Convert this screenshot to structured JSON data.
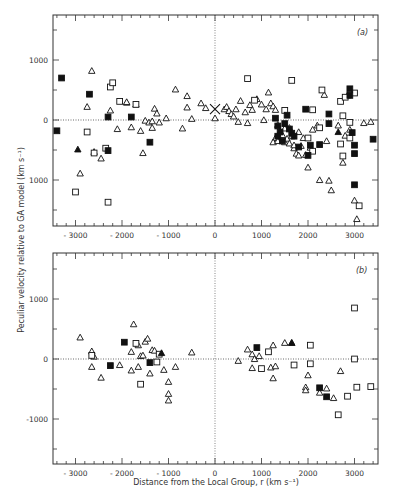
{
  "chart_data": [
    {
      "type": "scatter",
      "panel_label": "(a)",
      "xlabel": "Distance from the Local Group, r (km s⁻¹)",
      "ylabel": "Peculiar velocity relative to GA model (km s⁻¹)",
      "xlim": [
        -3500,
        3500
      ],
      "ylim": [
        -1750,
        1750
      ],
      "x_ticks": [
        -3000,
        -2000,
        -1000,
        0,
        1000,
        2000,
        3000
      ],
      "y_ticks": [
        1000,
        0,
        -1000
      ],
      "y_tick_labels": [
        "1000",
        "0",
        "1000"
      ],
      "reference_lines": {
        "horizontal_zero": "dotted",
        "vertical_zero": "dotted"
      },
      "series": [
        {
          "name": "open triangles",
          "marker": "triangle-open",
          "points": [
            [
              -2650,
              820
            ],
            [
              -2750,
              220
            ],
            [
              -2250,
              160
            ],
            [
              -2100,
              -150
            ],
            [
              -1900,
              290
            ],
            [
              -1700,
              260
            ],
            [
              -1800,
              -120
            ],
            [
              -1600,
              -180
            ],
            [
              -1550,
              -550
            ],
            [
              -1500,
              -10
            ],
            [
              -1420,
              -40
            ],
            [
              -1350,
              -20
            ],
            [
              -1350,
              -130
            ],
            [
              -1300,
              190
            ],
            [
              -1250,
              110
            ],
            [
              -1200,
              -40
            ],
            [
              -1050,
              30
            ],
            [
              -850,
              510
            ],
            [
              -700,
              -140
            ],
            [
              -600,
              400
            ],
            [
              -600,
              210
            ],
            [
              -500,
              20
            ],
            [
              -2450,
              -640
            ],
            [
              -2900,
              -890
            ],
            [
              -2600,
              -530
            ],
            [
              -1900,
              300
            ],
            [
              -300,
              280
            ],
            [
              -200,
              200
            ],
            [
              0,
              30
            ],
            [
              200,
              180
            ],
            [
              250,
              220
            ],
            [
              300,
              150
            ],
            [
              350,
              100
            ],
            [
              400,
              60
            ],
            [
              450,
              180
            ],
            [
              500,
              -30
            ],
            [
              550,
              320
            ],
            [
              650,
              130
            ],
            [
              700,
              -50
            ],
            [
              750,
              250
            ],
            [
              800,
              170
            ],
            [
              900,
              350
            ],
            [
              1000,
              260
            ],
            [
              1050,
              0
            ],
            [
              1100,
              180
            ],
            [
              1150,
              460
            ],
            [
              1200,
              280
            ],
            [
              1250,
              230
            ],
            [
              1300,
              170
            ],
            [
              1350,
              -80
            ],
            [
              1400,
              -230
            ],
            [
              1450,
              -250
            ],
            [
              1500,
              -370
            ],
            [
              1550,
              -310
            ],
            [
              1600,
              -130
            ],
            [
              1650,
              -270
            ],
            [
              1700,
              -470
            ],
            [
              1750,
              -560
            ],
            [
              1800,
              -590
            ],
            [
              1850,
              -430
            ],
            [
              1900,
              -300
            ],
            [
              1950,
              -580
            ],
            [
              2000,
              -790
            ],
            [
              2100,
              -160
            ],
            [
              2200,
              -90
            ],
            [
              2250,
              -1000
            ],
            [
              2400,
              -350
            ],
            [
              2450,
              -1010
            ],
            [
              2500,
              -1170
            ],
            [
              2650,
              -90
            ],
            [
              2750,
              -710
            ],
            [
              2800,
              -260
            ],
            [
              2900,
              -160
            ],
            [
              3000,
              -1340
            ],
            [
              3050,
              -1650
            ],
            [
              3200,
              -50
            ],
            [
              3350,
              -30
            ],
            [
              2350,
              420
            ],
            [
              2850,
              410
            ],
            [
              1300,
              -300
            ],
            [
              1400,
              -190
            ],
            [
              1500,
              -140
            ],
            [
              1600,
              -390
            ],
            [
              1700,
              -420
            ],
            [
              1800,
              -200
            ],
            [
              2050,
              -460
            ],
            [
              1250,
              -370
            ],
            [
              1350,
              -350
            ]
          ]
        },
        {
          "name": "open squares",
          "marker": "square-open",
          "points": [
            [
              -2250,
              550
            ],
            [
              -2200,
              620
            ],
            [
              -2050,
              310
            ],
            [
              -1700,
              260
            ],
            [
              -2750,
              -200
            ],
            [
              -2600,
              -550
            ],
            [
              -2350,
              -470
            ],
            [
              -3000,
              -1200
            ],
            [
              -2300,
              -1370
            ],
            [
              700,
              690
            ],
            [
              850,
              330
            ],
            [
              1650,
              660
            ],
            [
              1500,
              160
            ],
            [
              2100,
              170
            ],
            [
              2300,
              500
            ],
            [
              2250,
              -130
            ],
            [
              2700,
              310
            ],
            [
              2750,
              70
            ],
            [
              2800,
              380
            ],
            [
              2900,
              -40
            ],
            [
              3000,
              450
            ],
            [
              2750,
              -600
            ],
            [
              2900,
              -300
            ],
            [
              2700,
              -400
            ],
            [
              3100,
              -1430
            ],
            [
              2100,
              -520
            ],
            [
              2000,
              -300
            ]
          ]
        },
        {
          "name": "filled squares",
          "marker": "square-filled",
          "points": [
            [
              -3300,
              700
            ],
            [
              -3400,
              -180
            ],
            [
              -2700,
              430
            ],
            [
              -2300,
              50
            ],
            [
              -1800,
              50
            ],
            [
              -2300,
              -510
            ],
            [
              -1400,
              -370
            ],
            [
              1300,
              30
            ],
            [
              1350,
              -100
            ],
            [
              1400,
              -200
            ],
            [
              1450,
              -350
            ],
            [
              1500,
              -60
            ],
            [
              1600,
              -150
            ],
            [
              1650,
              -220
            ],
            [
              1700,
              -270
            ],
            [
              1800,
              -450
            ],
            [
              1950,
              180
            ],
            [
              2050,
              -420
            ],
            [
              2000,
              -590
            ],
            [
              2250,
              -410
            ],
            [
              2450,
              100
            ],
            [
              2450,
              -60
            ],
            [
              2900,
              520
            ],
            [
              2900,
              410
            ],
            [
              2950,
              -210
            ],
            [
              3000,
              -420
            ],
            [
              3000,
              -560
            ],
            [
              3400,
              -320
            ],
            [
              3000,
              -1080
            ],
            [
              1550,
              80
            ],
            [
              1350,
              -270
            ]
          ]
        },
        {
          "name": "filled triangles",
          "marker": "triangle-filled",
          "points": [
            [
              -2950,
              -490
            ],
            [
              2650,
              -200
            ]
          ]
        },
        {
          "name": "cross (Local Group)",
          "marker": "cross",
          "points": [
            [
              0,
              180
            ]
          ]
        }
      ]
    },
    {
      "type": "scatter",
      "panel_label": "(b)",
      "xlabel": "Distance from the Local Group, r (km s⁻¹)",
      "ylabel": "Peculiar velocity relative to GA model (km s⁻¹)",
      "xlim": [
        -3500,
        3500
      ],
      "ylim": [
        -1750,
        1750
      ],
      "x_ticks": [
        -3000,
        -2000,
        -1000,
        0,
        1000,
        2000,
        3000
      ],
      "y_ticks": [
        1000,
        0,
        -1000
      ],
      "y_tick_labels": [
        "1000",
        "0",
        "-1000"
      ],
      "reference_lines": {
        "horizontal_zero": "dotted",
        "vertical_zero": "dotted"
      },
      "series": [
        {
          "name": "open triangles",
          "marker": "triangle-open",
          "points": [
            [
              -2900,
              360
            ],
            [
              -2650,
              130
            ],
            [
              -2600,
              40
            ],
            [
              -2650,
              -130
            ],
            [
              -2450,
              -310
            ],
            [
              -2050,
              -100
            ],
            [
              -1800,
              -190
            ],
            [
              -1800,
              120
            ],
            [
              -1750,
              580
            ],
            [
              -1650,
              230
            ],
            [
              -1600,
              50
            ],
            [
              -1550,
              60
            ],
            [
              -1500,
              290
            ],
            [
              -1450,
              340
            ],
            [
              -1400,
              -240
            ],
            [
              -1350,
              150
            ],
            [
              -1300,
              140
            ],
            [
              -1100,
              -180
            ],
            [
              -1000,
              -380
            ],
            [
              -1000,
              -580
            ],
            [
              -1000,
              -690
            ],
            [
              -850,
              -130
            ],
            [
              -1650,
              -130
            ],
            [
              -500,
              110
            ],
            [
              500,
              -30
            ],
            [
              700,
              160
            ],
            [
              800,
              80
            ],
            [
              850,
              0
            ],
            [
              800,
              -150
            ],
            [
              950,
              50
            ],
            [
              1200,
              -140
            ],
            [
              1250,
              230
            ],
            [
              1250,
              -320
            ],
            [
              1300,
              -120
            ],
            [
              1500,
              270
            ],
            [
              1650,
              270
            ],
            [
              1950,
              -470
            ],
            [
              1950,
              -520
            ],
            [
              2000,
              -270
            ],
            [
              2250,
              -560
            ],
            [
              2400,
              -490
            ],
            [
              2550,
              -650
            ],
            [
              2700,
              -200
            ]
          ]
        },
        {
          "name": "open squares",
          "marker": "square-open",
          "points": [
            [
              -2650,
              60
            ],
            [
              -1700,
              260
            ],
            [
              -1250,
              -50
            ],
            [
              -1200,
              80
            ],
            [
              -1600,
              -420
            ],
            [
              1000,
              -160
            ],
            [
              1150,
              120
            ],
            [
              1700,
              -100
            ],
            [
              2050,
              230
            ],
            [
              2050,
              -80
            ],
            [
              3000,
              850
            ],
            [
              3000,
              0
            ],
            [
              3050,
              -470
            ],
            [
              2850,
              -620
            ],
            [
              2650,
              -930
            ],
            [
              3350,
              -460
            ]
          ]
        },
        {
          "name": "filled squares",
          "marker": "square-filled",
          "points": [
            [
              -2250,
              -110
            ],
            [
              -1950,
              280
            ],
            [
              -1400,
              -60
            ],
            [
              900,
              190
            ],
            [
              2250,
              -480
            ],
            [
              2400,
              -630
            ]
          ]
        },
        {
          "name": "filled triangles",
          "marker": "triangle-filled",
          "points": [
            [
              -1150,
              100
            ],
            [
              1650,
              270
            ]
          ]
        }
      ]
    }
  ],
  "labels": {
    "panel_a": "(a)",
    "panel_b": "(b)",
    "xlabel": "Distance from the Local Group, r (km s⁻¹)",
    "ylabel": "Peculiar velocity relative to GA model (km s⁻¹)"
  }
}
